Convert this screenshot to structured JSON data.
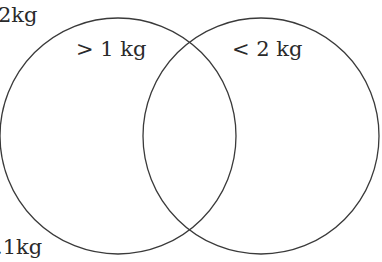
{
  "diagram": {
    "type": "venn",
    "stroke_color": "#3a3a3a",
    "text_color": "#2a2a2a",
    "sets": [
      {
        "label": "> 1 kg",
        "cx": 118,
        "cy": 136,
        "r": 118
      },
      {
        "label": "< 2 kg",
        "cx": 261,
        "cy": 136,
        "r": 118
      }
    ],
    "outside_labels": {
      "top_left": "2kg",
      "bottom_left": ".1kg"
    }
  }
}
